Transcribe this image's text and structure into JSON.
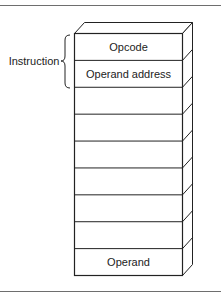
{
  "figure": {
    "type": "memory-stack-diagram",
    "cells": [
      {
        "label": "Opcode"
      },
      {
        "label": "Operand address"
      },
      {
        "label": ""
      },
      {
        "label": ""
      },
      {
        "label": ""
      },
      {
        "label": ""
      },
      {
        "label": ""
      },
      {
        "label": ""
      },
      {
        "label": "Operand"
      }
    ],
    "brace": {
      "label": "Instruction",
      "spans_cells": [
        0,
        1
      ]
    },
    "colors": {
      "stroke": "#222222",
      "rule": "#6e6e6e",
      "background": "#ffffff"
    }
  }
}
